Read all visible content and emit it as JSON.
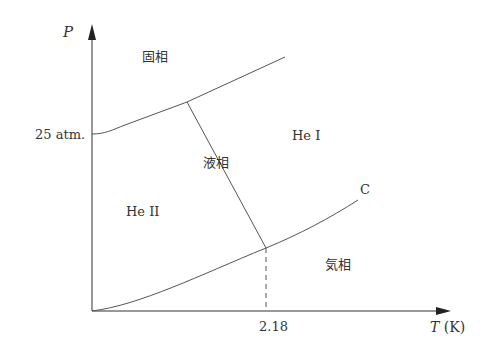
{
  "diagram": {
    "type": "phase-diagram",
    "axes": {
      "y_label": "P",
      "x_label": "T",
      "x_unit": "(K)",
      "y_tick": "25 atm.",
      "x_tick": "2.18"
    },
    "regions": {
      "solid": "固相",
      "he1": "He I",
      "liquid": "液相",
      "he2": "He II",
      "gas": "気相"
    },
    "points": {
      "critical": "C"
    },
    "colors": {
      "line": "#555555",
      "axis": "#333333",
      "text": "#333333"
    }
  }
}
